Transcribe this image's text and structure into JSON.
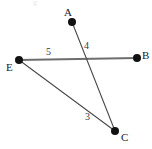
{
  "figure": {
    "kind": "geometry-diagram",
    "width": 152,
    "height": 149,
    "background_color": "#ffffff",
    "top_artifact_text": "g",
    "points": [
      {
        "id": "A",
        "label": "A",
        "x": 72,
        "y": 22,
        "label_x": 64,
        "label_y": 7,
        "dot_radius": 4,
        "dot_color": "#111111"
      },
      {
        "id": "B",
        "label": "B",
        "x": 137,
        "y": 58,
        "label_x": 142,
        "label_y": 50,
        "dot_radius": 4,
        "dot_color": "#111111"
      },
      {
        "id": "E",
        "label": "E",
        "x": 19,
        "y": 60,
        "label_x": 6,
        "label_y": 62,
        "dot_radius": 4,
        "dot_color": "#111111"
      },
      {
        "id": "C",
        "label": "C",
        "x": 115,
        "y": 131,
        "label_x": 121,
        "label_y": 132,
        "dot_radius": 4,
        "dot_color": "#111111"
      }
    ],
    "segments": [
      {
        "id": "EB",
        "from": "E",
        "to": "B",
        "x1": 19,
        "y1": 60,
        "x2": 137,
        "y2": 58,
        "color": "#6e6e6e",
        "width": 2.1
      },
      {
        "id": "AC",
        "from": "A",
        "to": "C",
        "x1": 72,
        "y1": 22,
        "x2": 115,
        "y2": 131,
        "color": "#4a4a4a",
        "width": 1.1
      },
      {
        "id": "EC",
        "from": "E",
        "to": "C",
        "x1": 19,
        "y1": 60,
        "x2": 115,
        "y2": 131,
        "color": "#4a4a4a",
        "width": 1.1
      }
    ],
    "segment_labels": [
      {
        "id": "label-5",
        "text": "5",
        "x": 46,
        "y": 47,
        "for_segment": "EB"
      },
      {
        "id": "label-4",
        "text": "4",
        "x": 84,
        "y": 41,
        "for_segment": "AC"
      },
      {
        "id": "label-3",
        "text": "3",
        "x": 85,
        "y": 112,
        "for_segment": "EC"
      }
    ],
    "intersection": {
      "x": 92,
      "y": 58,
      "of": [
        "AC",
        "EB"
      ]
    }
  }
}
